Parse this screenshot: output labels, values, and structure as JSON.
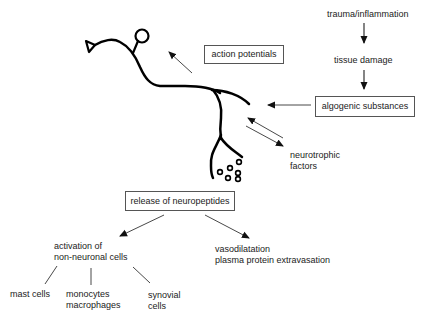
{
  "diagram": {
    "title": "",
    "cascade": {
      "step1": "trauma/inflammation",
      "step2": "tissue damage",
      "step3": "algogenic substances"
    },
    "neuron_outputs": {
      "action_potentials": "action potentials",
      "neurotrophic_line1": "neurotrophic",
      "neurotrophic_line2": "factors",
      "release": "release of neuropeptides"
    },
    "effects": {
      "activation_line1": "activation of",
      "activation_line2": "non-neuronal cells",
      "vaso_line1": "vasodilatation",
      "vaso_line2": "plasma protein extravasation"
    },
    "cells": {
      "mast": "mast  cells",
      "mono_line1": "monocytes",
      "mono_line2": "macrophages",
      "syn_line1": "synovial",
      "syn_line2": "cells"
    },
    "colors": {
      "neuron": "#000000",
      "arrows": "#333333",
      "box_border": "#555555",
      "text": "#222222"
    }
  }
}
